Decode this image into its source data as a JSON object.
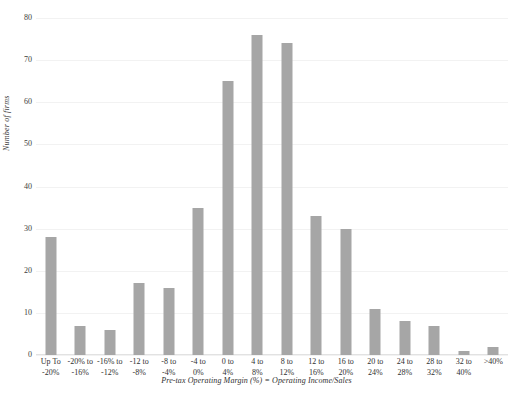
{
  "chart_data": {
    "type": "bar",
    "title": "",
    "subtitle": "",
    "xlabel": "Pre-tax Operating Margin (%) = Operating Income/Sales",
    "ylabel": "Number of firms",
    "categories": [
      "Up To -20%",
      "-20% to -16%",
      "-16% to -12%",
      "-12 to -8%",
      "-8 to -4%",
      "-4 to 0%",
      "0 to 4%",
      "4 to 8%",
      "8 to 12%",
      "12 to 16%",
      "16 to 20%",
      "20 to 24%",
      "24 to 28%",
      "28 to 32%",
      "32 to 40%",
      ">40%"
    ],
    "category_lines": [
      [
        "Up To",
        "-20%"
      ],
      [
        "-20% to",
        "-16%"
      ],
      [
        "-16% to",
        "-12%"
      ],
      [
        "-12 to",
        "-8%"
      ],
      [
        "-8 to",
        "-4%"
      ],
      [
        "-4 to",
        "0%"
      ],
      [
        "0 to",
        "4%"
      ],
      [
        "4 to",
        "8%"
      ],
      [
        "8 to",
        "12%"
      ],
      [
        "12 to",
        "16%"
      ],
      [
        "16 to",
        "20%"
      ],
      [
        "20 to",
        "24%"
      ],
      [
        "24 to",
        "28%"
      ],
      [
        "28 to",
        "32%"
      ],
      [
        "32 to",
        "40%"
      ],
      [
        ">40%",
        ""
      ]
    ],
    "values": [
      28,
      7,
      6,
      17,
      16,
      35,
      65,
      76,
      74,
      33,
      30,
      11,
      8,
      7,
      1,
      2
    ],
    "ylim": [
      0,
      80
    ],
    "yticks": [
      0,
      10,
      20,
      30,
      40,
      50,
      60,
      70,
      80
    ],
    "grid": true,
    "legend": "none",
    "bar_color": "#a6a6a6",
    "gridline_color": "#f2f2f2",
    "background_color": "#ffffff"
  }
}
